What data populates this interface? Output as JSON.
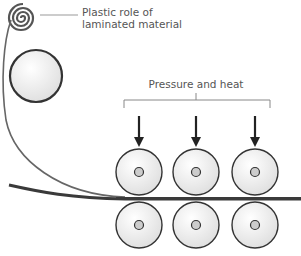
{
  "diagram": {
    "labels": {
      "roll_line1": "Plastic role of",
      "roll_line2": "laminated material",
      "pressure": "Pressure and heat"
    },
    "colors": {
      "stroke": "#333333",
      "thin_line": "#666666",
      "roller_fill": "#f2f2f2",
      "hub_fill": "#cccccc",
      "laminate": "#3a3a3a",
      "label_text": "#555555"
    },
    "rollers": {
      "columns_x": [
        139,
        196,
        255
      ],
      "top_y": 172,
      "bottom_y": 225,
      "radius": 23
    },
    "arrow_count": 3
  }
}
